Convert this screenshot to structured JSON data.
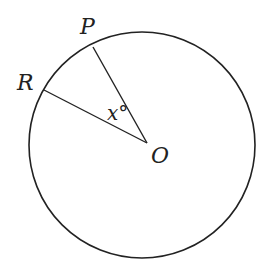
{
  "diagram": {
    "type": "circle-central-angle",
    "points": {
      "P": "P",
      "R": "R",
      "O": "O"
    },
    "angle_label": "x°"
  }
}
